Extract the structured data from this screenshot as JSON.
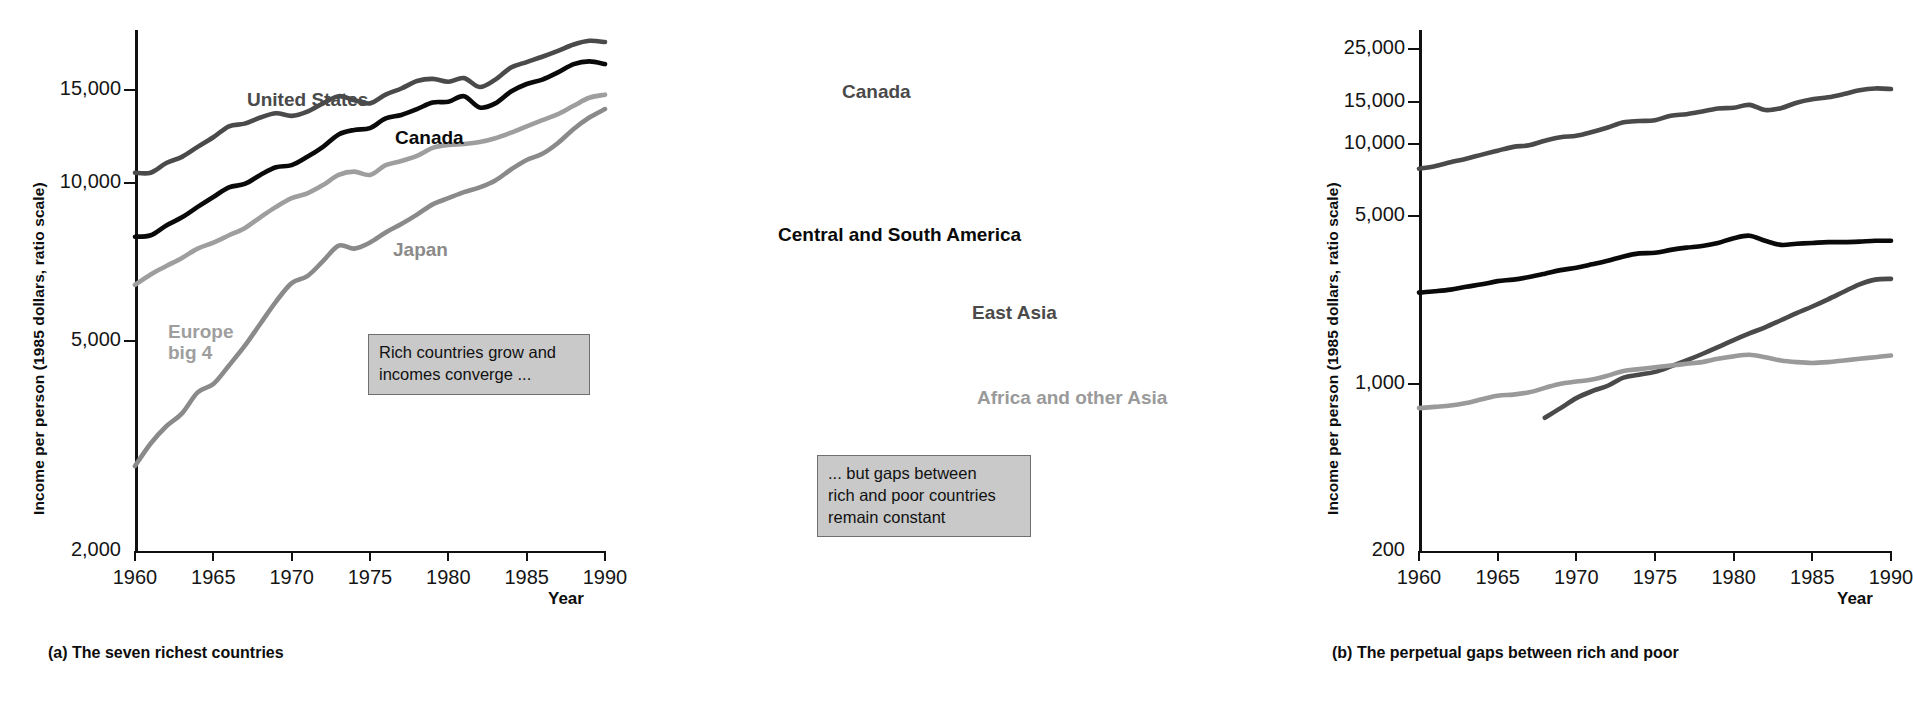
{
  "figure": {
    "panels": [
      {
        "id": "a",
        "caption": "(a) The seven richest countries",
        "ylabel": "Income per person (1985 dollars, ratio scale)",
        "xlabel": "Year",
        "callout": "Rich countries grow and\nincomes converge ...",
        "ytick_labels": [
          "15,000",
          "10,000",
          "5,000",
          "2,000"
        ],
        "xtick_labels": [
          "1960",
          "1965",
          "1970",
          "1975",
          "1980",
          "1985",
          "1990"
        ],
        "series_labels": [
          {
            "name": "United States",
            "color": "#4a4a4a"
          },
          {
            "name": "Canada",
            "color": "#0a0a0a"
          },
          {
            "name": "Japan",
            "color": "#8a8a8a"
          },
          {
            "name": "Europe\nbig 4",
            "color": "#9e9e9e"
          }
        ]
      },
      {
        "id": "b",
        "caption": "(b) The perpetual gaps between rich and poor",
        "ylabel": "Income per person (1985 dollars, ratio scale)",
        "xlabel": "Year",
        "callout": "... but gaps between\nrich and poor countries\nremain constant",
        "ytick_labels": [
          "25,000",
          "15,000",
          "10,000",
          "5,000",
          "1,000",
          "200"
        ],
        "xtick_labels": [
          "1960",
          "1965",
          "1970",
          "1975",
          "1980",
          "1985",
          "1990"
        ],
        "series_labels": [
          {
            "name": "Canada",
            "color": "#4a4a4a"
          },
          {
            "name": "Central and South America",
            "color": "#0a0a0a"
          },
          {
            "name": "East Asia",
            "color": "#4a4a4a"
          },
          {
            "name": "Africa and other Asia",
            "color": "#9a9a9a"
          }
        ]
      }
    ]
  },
  "chart_data": [
    {
      "type": "line",
      "panel": "a",
      "title": "(a) The seven richest countries",
      "xlabel": "Year",
      "ylabel": "Income per person (1985 dollars, ratio scale)",
      "yscale": "log",
      "ylim": [
        2000,
        19500
      ],
      "xlim": [
        1960,
        1990
      ],
      "yticks": [
        15000,
        10000,
        5000,
        2000
      ],
      "ytick_labels": [
        "15,000",
        "10,000",
        "5,000",
        "2,000"
      ],
      "xticks": [
        1960,
        1965,
        1970,
        1975,
        1980,
        1985,
        1990
      ],
      "xtick_labels": [
        "1960",
        "1965",
        "1970",
        "1975",
        "1980",
        "1985",
        "1990"
      ],
      "grid": false,
      "legend": "inline-labels",
      "x": [
        1960,
        1961,
        1962,
        1963,
        1964,
        1965,
        1966,
        1967,
        1968,
        1969,
        1970,
        1971,
        1972,
        1973,
        1974,
        1975,
        1976,
        1977,
        1978,
        1979,
        1980,
        1981,
        1982,
        1983,
        1984,
        1985,
        1986,
        1987,
        1988,
        1989,
        1990
      ],
      "series": [
        {
          "name": "United States",
          "color": "#4a4a4a",
          "values": [
            10450,
            10450,
            10900,
            11200,
            11700,
            12200,
            12800,
            12950,
            13300,
            13550,
            13400,
            13650,
            14150,
            14600,
            14350,
            14150,
            14700,
            15100,
            15600,
            15750,
            15550,
            15800,
            15200,
            15700,
            16550,
            16950,
            17350,
            17800,
            18300,
            18600,
            18500
          ]
        },
        {
          "name": "Canada",
          "color": "#0a0a0a",
          "values": [
            7900,
            7950,
            8300,
            8600,
            9000,
            9400,
            9800,
            9950,
            10350,
            10700,
            10800,
            11200,
            11700,
            12350,
            12600,
            12700,
            13250,
            13450,
            13800,
            14200,
            14250,
            14600,
            13900,
            14150,
            14900,
            15400,
            15700,
            16200,
            16800,
            17000,
            16800
          ]
        },
        {
          "name": "Japan",
          "color": "#8a8a8a",
          "values": [
            2900,
            3200,
            3450,
            3650,
            4000,
            4150,
            4500,
            4900,
            5400,
            5950,
            6450,
            6650,
            7100,
            7600,
            7500,
            7700,
            8050,
            8350,
            8700,
            9100,
            9350,
            9600,
            9800,
            10100,
            10600,
            11050,
            11350,
            11900,
            12650,
            13300,
            13800
          ]
        },
        {
          "name": "Europe big 4",
          "color": "#9e9e9e",
          "values": [
            6400,
            6700,
            6950,
            7200,
            7500,
            7700,
            7950,
            8200,
            8600,
            9000,
            9350,
            9550,
            9900,
            10350,
            10500,
            10350,
            10800,
            11000,
            11250,
            11650,
            11800,
            11850,
            11950,
            12150,
            12450,
            12800,
            13150,
            13500,
            14000,
            14500,
            14700
          ]
        }
      ]
    },
    {
      "type": "line",
      "panel": "b",
      "title": "(b) The perpetual gaps between rich and poor",
      "xlabel": "Year",
      "ylabel": "Income per person (1985 dollars, ratio scale)",
      "yscale": "log",
      "ylim": [
        200,
        30000
      ],
      "xlim": [
        1960,
        1990
      ],
      "yticks": [
        25000,
        15000,
        10000,
        5000,
        1000,
        200
      ],
      "ytick_labels": [
        "25,000",
        "15,000",
        "10,000",
        "5,000",
        "1,000",
        "200"
      ],
      "xticks": [
        1960,
        1965,
        1970,
        1975,
        1980,
        1985,
        1990
      ],
      "xtick_labels": [
        "1960",
        "1965",
        "1970",
        "1975",
        "1980",
        "1985",
        "1990"
      ],
      "grid": false,
      "legend": "inline-labels",
      "x": [
        1960,
        1961,
        1962,
        1963,
        1964,
        1965,
        1966,
        1967,
        1968,
        1969,
        1970,
        1971,
        1972,
        1973,
        1974,
        1975,
        1976,
        1977,
        1978,
        1979,
        1980,
        1981,
        1982,
        1983,
        1984,
        1985,
        1986,
        1987,
        1988,
        1989,
        1990
      ],
      "series": [
        {
          "name": "Canada",
          "color": "#4a4a4a",
          "values": [
            7900,
            8100,
            8400,
            8700,
            9050,
            9400,
            9750,
            9900,
            10350,
            10700,
            10850,
            11250,
            11750,
            12350,
            12500,
            12600,
            13150,
            13350,
            13700,
            14100,
            14200,
            14600,
            13900,
            14150,
            14900,
            15400,
            15700,
            16200,
            16800,
            17100,
            17000
          ]
        },
        {
          "name": "Central and South America",
          "color": "#0a0a0a",
          "values": [
            2400,
            2430,
            2470,
            2540,
            2600,
            2680,
            2720,
            2790,
            2880,
            2980,
            3050,
            3150,
            3260,
            3400,
            3500,
            3520,
            3620,
            3700,
            3760,
            3870,
            4050,
            4150,
            3950,
            3800,
            3840,
            3870,
            3900,
            3900,
            3920,
            3950,
            3950
          ]
        },
        {
          "name": "East Asia",
          "color": "#4a4a4a",
          "values": [
            null,
            null,
            null,
            null,
            null,
            null,
            null,
            null,
            720,
            790,
            870,
            930,
            980,
            1060,
            1090,
            1120,
            1180,
            1250,
            1330,
            1420,
            1520,
            1620,
            1720,
            1840,
            1970,
            2100,
            2250,
            2420,
            2600,
            2720,
            2740
          ]
        },
        {
          "name": "Africa and other Asia",
          "color": "#9a9a9a",
          "values": [
            790,
            800,
            810,
            830,
            860,
            890,
            900,
            920,
            960,
            1000,
            1020,
            1040,
            1080,
            1130,
            1150,
            1170,
            1190,
            1210,
            1230,
            1270,
            1300,
            1320,
            1290,
            1250,
            1230,
            1220,
            1230,
            1250,
            1270,
            1290,
            1310
          ]
        }
      ]
    }
  ]
}
